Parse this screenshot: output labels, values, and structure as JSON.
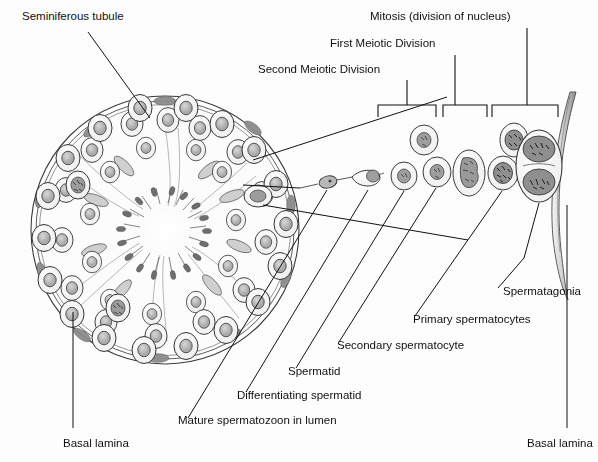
{
  "figure": {
    "title_label": "Seminiferous tubule",
    "background_color": "#fdfdfd",
    "ink_color": "#111111"
  },
  "labels": {
    "seminiferous_tubule": "Seminiferous tubule",
    "mitosis": "Mitosis (division of nucleus)",
    "first_meiotic": "First Meiotic Division",
    "second_meiotic": "Second Meiotic Division",
    "spermatogonia": "Spermatagonia",
    "primary_spermatocytes": "Primary spermatocytes",
    "secondary_spermatocyte": "Secondary spermatocyte",
    "spermatid": "Spermatid",
    "differentiating_spermatid": "Differentiating spermatid",
    "mature_spermatozoon": "Mature spermatozoon in lumen",
    "basal_lamina_left": "Basal lamina",
    "basal_lamina_right": "Basal lamina"
  },
  "brackets": [
    {
      "name": "second-meiotic-division",
      "label": "Second Meiotic Division",
      "x1": 378,
      "x2": 436,
      "y": 105,
      "stem_x": 407,
      "stem_top": 80
    },
    {
      "name": "first-meiotic-division",
      "label": "First Meiotic Division",
      "x1": 443,
      "x2": 487,
      "y": 105,
      "stem_x": 455,
      "stem_top": 55
    },
    {
      "name": "mitosis",
      "label": "Mitosis (division of nucleus)",
      "x1": 492,
      "x2": 558,
      "y": 105,
      "stem_x": 527,
      "stem_top": 28
    }
  ],
  "cell_series": [
    {
      "name": "mature-spermatozoon",
      "stage": "Mature spermatozoon in lumen",
      "cx": 327,
      "cy": 183,
      "kind": "sperm"
    },
    {
      "name": "differentiating-spermatid",
      "stage": "Differentiating spermatid",
      "cx": 369,
      "cy": 177,
      "kind": "differentiating"
    },
    {
      "name": "spermatid",
      "stage": "Spermatid",
      "cx": 404,
      "cy": 176,
      "kind": "round"
    },
    {
      "name": "spermatid-upper",
      "stage": "Spermatid",
      "cx": 424,
      "cy": 140,
      "kind": "round"
    },
    {
      "name": "secondary-spermatocyte",
      "stage": "Secondary spermatocyte",
      "cx": 436,
      "cy": 172,
      "kind": "round"
    },
    {
      "name": "primary-spermatocyte-elongate",
      "stage": "Primary spermatocytes",
      "cx": 469,
      "cy": 173,
      "kind": "elongate"
    },
    {
      "name": "primary-spermatocyte-upper",
      "stage": "Primary spermatocytes",
      "cx": 514,
      "cy": 140,
      "kind": "mitotic"
    },
    {
      "name": "primary-spermatocyte-lower",
      "stage": "Primary spermatocytes",
      "cx": 503,
      "cy": 173,
      "kind": "mitotic"
    },
    {
      "name": "spermatogonia-dividing",
      "stage": "Spermatagonia",
      "cx": 539,
      "cy": 166,
      "kind": "dividing-pair"
    }
  ],
  "tubule": {
    "name": "seminiferous-tubule-cross-section",
    "cx": 165,
    "cy": 230,
    "r": 135,
    "lumen_r": 26,
    "sectors": 6
  },
  "leaders": {
    "seminiferous_tubule": {
      "from": [
        88,
        30
      ],
      "to": [
        150,
        118
      ]
    },
    "basal_lamina_left": {
      "from": [
        73,
        310
      ],
      "to": [
        73,
        428
      ]
    },
    "basal_lamina_right": {
      "from": [
        567,
        200
      ],
      "to": [
        567,
        428
      ]
    }
  }
}
